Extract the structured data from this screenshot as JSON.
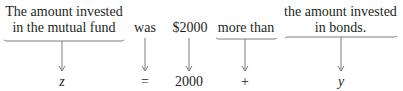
{
  "diagram": {
    "phrases": [
      {
        "id": "mutual_fund",
        "line1": "The amount invested",
        "line2": "in the mutual fund"
      },
      {
        "id": "was",
        "text": "was"
      },
      {
        "id": "amount",
        "text": "$2000"
      },
      {
        "id": "more_than",
        "text": "more than"
      },
      {
        "id": "bonds",
        "line1": "the amount invested",
        "line2": "in bonds."
      }
    ],
    "symbols": [
      {
        "id": "z",
        "text": "z"
      },
      {
        "id": "equals",
        "text": "="
      },
      {
        "id": "num",
        "text": "2000"
      },
      {
        "id": "plus",
        "text": "+"
      },
      {
        "id": "y",
        "text": "y"
      }
    ],
    "colors": {
      "text": "#231f20",
      "lines": "#7f7f7f"
    }
  }
}
